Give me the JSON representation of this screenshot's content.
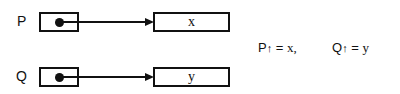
{
  "diagram": {
    "pointers": [
      {
        "name": "P",
        "target_value": "x"
      },
      {
        "name": "Q",
        "target_value": "y"
      }
    ],
    "equations": {
      "p_lhs": "P",
      "p_arrow": "↑",
      "p_eq": "=",
      "p_rhs": "x,",
      "q_lhs": "Q",
      "q_arrow": "↑",
      "q_eq": "=",
      "q_rhs": "y"
    }
  }
}
